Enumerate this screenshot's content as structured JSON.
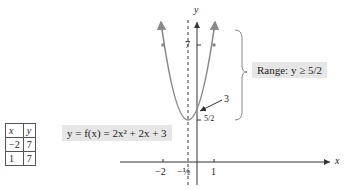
{
  "table": {
    "headers": [
      "x",
      "y"
    ],
    "rows": [
      [
        "−2",
        "7"
      ],
      [
        "1",
        "7"
      ]
    ]
  },
  "equation": "y = f(x) = 2x² + 2x + 3",
  "range_label": "Range: y ≥ 5/2",
  "axes": {
    "x_label": "x",
    "y_label": "y",
    "x_ticks": [
      "−2",
      "−½",
      "1"
    ],
    "y_ticks": [
      "7",
      "5/2"
    ]
  },
  "annotation": "3",
  "colors": {
    "curve": "#8a8a8a",
    "axis": "#333333",
    "box_bg": "#e6e6e6"
  }
}
